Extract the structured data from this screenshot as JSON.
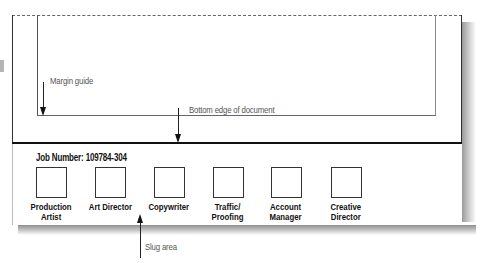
{
  "diagram": {
    "callouts": {
      "margin_guide": "Margin guide",
      "bottom_edge": "Bottom edge of document",
      "slug_area": "Slug area"
    },
    "slug": {
      "job_number": "Job Number: 109784-304",
      "signoffs": [
        {
          "line1": "Production",
          "line2": "Artist"
        },
        {
          "line1": "Art Director",
          "line2": ""
        },
        {
          "line1": "Copywriter",
          "line2": ""
        },
        {
          "line1": "Traffic/",
          "line2": "Proofing"
        },
        {
          "line1": "Account",
          "line2": "Manager"
        },
        {
          "line1": "Creative",
          "line2": "Director"
        }
      ]
    }
  }
}
